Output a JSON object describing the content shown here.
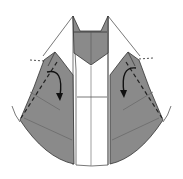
{
  "diagram": {
    "type": "origami-step",
    "colors": {
      "paper_colored": "#8a8a8a",
      "paper_white": "#ffffff",
      "line": "#3a3a3a",
      "arrow": "#111111"
    },
    "elements": [
      {
        "name": "collar-head",
        "shape": "pentagon with V notch",
        "color": "gray"
      },
      {
        "name": "left-lapel-flap",
        "color": "gray",
        "fold": "valley",
        "arrow": "curved down"
      },
      {
        "name": "right-lapel-flap",
        "color": "gray",
        "fold": "valley",
        "arrow": "curved down"
      },
      {
        "name": "center-strip",
        "color": "white"
      },
      {
        "name": "outer-edge-arc",
        "shape": "circular arc bottom"
      }
    ],
    "annotations": []
  }
}
